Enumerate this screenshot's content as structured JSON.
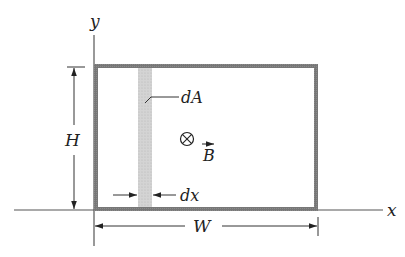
{
  "diagram": {
    "axes": {
      "x_label": "x",
      "y_label": "y"
    },
    "dimensions": {
      "height_label": "H",
      "width_label": "W",
      "strip_width_label": "dx"
    },
    "strip": {
      "area_label": "dA"
    },
    "field": {
      "symbol": "⊗",
      "symbol_meaning": "into-page",
      "vector_label": "B",
      "vector_arrow": "→"
    },
    "colors": {
      "loop_border": "#6e6e6e",
      "strip_fill": "#cfcfcf",
      "axis": "#555555",
      "text": "#222222"
    }
  }
}
